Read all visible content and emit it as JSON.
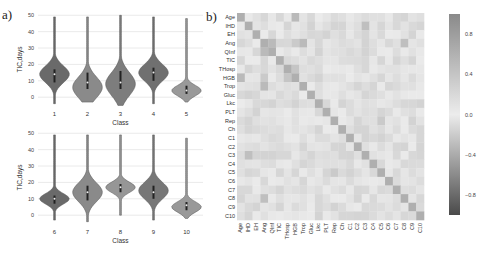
{
  "panel_a_label": "a)",
  "panel_b_label": "b)",
  "chart_data": [
    {
      "type": "violin",
      "panel": "a-top",
      "title": "",
      "xlabel": "Class",
      "ylabel": "TIC,days",
      "ylim": [
        -6,
        52
      ],
      "yticks": [
        0,
        10,
        20,
        30,
        40,
        50
      ],
      "grid": true,
      "categories": [
        "1",
        "2",
        "3",
        "4",
        "5"
      ],
      "series": [
        {
          "class": "1",
          "min": -4,
          "max": 49,
          "median": 14,
          "q1": 9,
          "q3": 17,
          "mode": 14,
          "color": "#6a6a6a"
        },
        {
          "class": "2",
          "min": -3,
          "max": 49,
          "median": 9,
          "q1": 5,
          "q3": 15,
          "mode": 6,
          "color": "#8a8a8a"
        },
        {
          "class": "3",
          "min": -5,
          "max": 50,
          "median": 9,
          "q1": 5,
          "q3": 16,
          "mode": 8,
          "color": "#7d7d7d"
        },
        {
          "class": "4",
          "min": -4,
          "max": 49,
          "median": 15,
          "q1": 10,
          "q3": 18,
          "mode": 15,
          "color": "#707070"
        },
        {
          "class": "5",
          "min": -3,
          "max": 48,
          "median": 4,
          "q1": 2,
          "q3": 7,
          "mode": 4,
          "color": "#999999"
        }
      ]
    },
    {
      "type": "violin",
      "panel": "a-bottom",
      "title": "",
      "xlabel": "Class",
      "ylabel": "TIC,days",
      "ylim": [
        -6,
        52
      ],
      "yticks": [
        0,
        10,
        20,
        30,
        40,
        50
      ],
      "grid": true,
      "categories": [
        "6",
        "7",
        "8",
        "9",
        "10"
      ],
      "series": [
        {
          "class": "6",
          "min": -3,
          "max": 49,
          "median": 10,
          "q1": 7,
          "q3": 12,
          "mode": 10,
          "color": "#6a6a6a"
        },
        {
          "class": "7",
          "min": -4,
          "max": 49,
          "median": 14,
          "q1": 9,
          "q3": 18,
          "mode": 14,
          "color": "#8a8a8a"
        },
        {
          "class": "8",
          "min": 0,
          "max": 49,
          "median": 17,
          "q1": 14,
          "q3": 19,
          "mode": 17,
          "color": "#969696"
        },
        {
          "class": "9",
          "min": -3,
          "max": 49,
          "median": 14,
          "q1": 10,
          "q3": 18,
          "mode": 15,
          "color": "#777777"
        },
        {
          "class": "10",
          "min": -2,
          "max": 47,
          "median": 6,
          "q1": 3,
          "q3": 8,
          "mode": 5,
          "color": "#999999"
        }
      ]
    },
    {
      "type": "heatmap",
      "panel": "b",
      "title": "",
      "labels": [
        "Age",
        "IHD",
        "EH",
        "Ang",
        "QInf",
        "TIC",
        "THosp",
        "HGB",
        "Trop",
        "Gluc",
        "Lkc",
        "PLT",
        "Rep",
        "Ch",
        "C1",
        "C2",
        "C3",
        "C4",
        "C5",
        "C6",
        "C7",
        "C8",
        "C9",
        "C10"
      ],
      "colorbar": {
        "ticks": [
          0.8,
          0.4,
          0.0,
          -0.4,
          -0.8
        ],
        "tick_labels": [
          "0.8",
          "0.4",
          "0.0",
          "−0.4",
          "−0.8"
        ],
        "range": [
          -1,
          1
        ]
      },
      "strong_cells": [
        {
          "row": "Age",
          "col": "HGB",
          "value": 0.45
        },
        {
          "row": "HGB",
          "col": "Age",
          "value": 0.45
        },
        {
          "row": "Ang",
          "col": "QInf",
          "value": 0.45
        },
        {
          "row": "Ang",
          "col": "Trop",
          "value": 0.45
        },
        {
          "row": "Ang",
          "col": "HGB",
          "value": 0.3
        },
        {
          "row": "QInf",
          "col": "Ang",
          "value": 0.45
        },
        {
          "row": "Trop",
          "col": "Ang",
          "value": 0.45
        },
        {
          "row": "THosp",
          "col": "HGB",
          "value": 0.35
        },
        {
          "row": "C3",
          "col": "IHD",
          "value": 0.4
        },
        {
          "row": "C8",
          "col": "Ang",
          "value": 0.4
        },
        {
          "row": "C5",
          "col": "Rep",
          "value": 0.3
        },
        {
          "row": "Rep",
          "col": "C5",
          "value": 0.3
        }
      ]
    }
  ]
}
